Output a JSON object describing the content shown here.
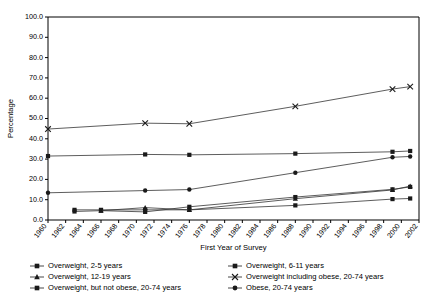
{
  "chart_data": {
    "type": "line",
    "title": "",
    "xlabel": "First Year of Survey",
    "ylabel": "Percentage",
    "xlim": [
      1960,
      2002
    ],
    "ylim": [
      0,
      100
    ],
    "ytick_labels": [
      "0.0",
      "10.0",
      "20.0",
      "30.0",
      "40.0",
      "50.0",
      "60.0",
      "70.0",
      "80.0",
      "90.0",
      "100.0"
    ],
    "ytick_values": [
      0,
      10,
      20,
      30,
      40,
      50,
      60,
      70,
      80,
      90,
      100
    ],
    "xtick_labels": [
      "1960",
      "1962",
      "1964",
      "1966",
      "1968",
      "1970",
      "1972",
      "1974",
      "1976",
      "1978",
      "1980",
      "1982",
      "1984",
      "1986",
      "1988",
      "1990",
      "1992",
      "1994",
      "1996",
      "1998",
      "2000",
      "2002"
    ],
    "xtick_values": [
      1960,
      1962,
      1964,
      1966,
      1968,
      1970,
      1972,
      1974,
      1976,
      1978,
      1980,
      1982,
      1984,
      1986,
      1988,
      1990,
      1992,
      1994,
      1996,
      1998,
      2000,
      2002
    ],
    "grid": false,
    "legend_position": "bottom",
    "series": [
      {
        "name": "Overweight, 2-5 years",
        "marker": "square",
        "x": [
          1963,
          1966,
          1971,
          1976,
          1988,
          1999,
          2001
        ],
        "values": [
          5.0,
          5.0,
          5.0,
          5.0,
          7.2,
          10.3,
          10.6
        ]
      },
      {
        "name": "Overweight, 6-11 years",
        "marker": "square",
        "x": [
          1963,
          1966,
          1971,
          1976,
          1988,
          1999,
          2001
        ],
        "values": [
          4.2,
          4.6,
          4.0,
          6.5,
          11.3,
          15.1,
          16.3
        ]
      },
      {
        "name": "Overweight, 12-19 years",
        "marker": "triangle",
        "x": [
          1966,
          1971,
          1976,
          1988,
          1999,
          2001
        ],
        "values": [
          4.6,
          6.1,
          5.0,
          10.5,
          14.8,
          16.7
        ]
      },
      {
        "name": "Overweight including obese, 20-74 years",
        "marker": "x",
        "x": [
          1960,
          1971,
          1976,
          1988,
          1999,
          2001
        ],
        "values": [
          44.8,
          47.7,
          47.4,
          56.0,
          64.5,
          65.7
        ]
      },
      {
        "name": "Overweight, but not obese, 20-74 years",
        "marker": "square",
        "x": [
          1960,
          1971,
          1976,
          1988,
          1999,
          2001
        ],
        "values": [
          31.5,
          32.3,
          32.1,
          32.7,
          33.6,
          34.0
        ]
      },
      {
        "name": "Obese, 20-74 years",
        "marker": "circle",
        "x": [
          1960,
          1971,
          1976,
          1988,
          1999,
          2001
        ],
        "values": [
          13.4,
          14.5,
          15.0,
          23.3,
          30.9,
          31.3
        ]
      }
    ]
  },
  "legend": {
    "entries": [
      {
        "label": "Overweight, 2-5 years",
        "marker": "square"
      },
      {
        "label": "Overweight, 6-11 years",
        "marker": "square"
      },
      {
        "label": "Overweight, 12-19 years",
        "marker": "triangle"
      },
      {
        "label": "Overweight including obese, 20-74 years",
        "marker": "x"
      },
      {
        "label": "Overweight, but not obese, 20-74 years",
        "marker": "square"
      },
      {
        "label": "Obese, 20-74 years",
        "marker": "circle"
      }
    ]
  }
}
